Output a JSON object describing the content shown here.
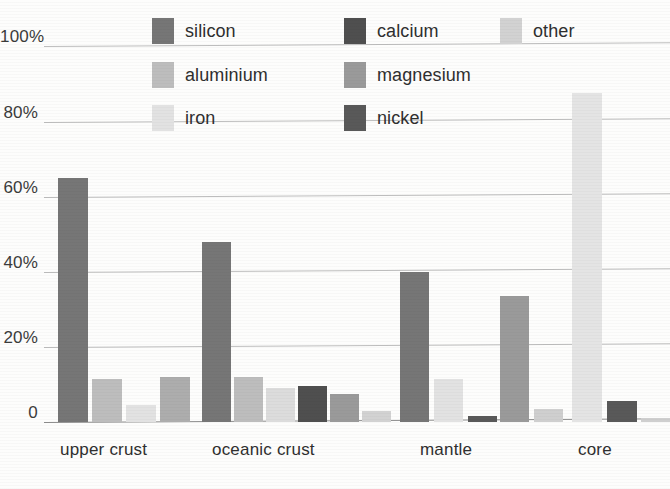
{
  "chart_data": {
    "type": "bar",
    "title": "",
    "subtitle": "",
    "xlabel": "",
    "ylabel": "",
    "ylim": [
      0,
      100
    ],
    "yticks": [
      0,
      20,
      40,
      60,
      80,
      100
    ],
    "ytick_labels": [
      "0",
      "20%",
      "40%",
      "60%",
      "80%",
      "100%"
    ],
    "grid": true,
    "legend_position": "top",
    "categories": [
      "upper crust",
      "oceanic crust",
      "mantle",
      "core"
    ],
    "series": [
      {
        "name": "silicon",
        "color": "#767676",
        "values": [
          65.0,
          48.0,
          40.0,
          null
        ]
      },
      {
        "name": "aluminium",
        "color": "#bdbdbd",
        "values": [
          11.5,
          12.0,
          null,
          null
        ]
      },
      {
        "name": "iron",
        "color": "#e2e2e2",
        "values": [
          4.5,
          9.0,
          11.5,
          87.5
        ]
      },
      {
        "name": "calcium",
        "color": "#4f4f4f",
        "values": [
          null,
          9.5,
          null,
          null
        ]
      },
      {
        "name": "nickel",
        "color": "#595959",
        "values": [
          null,
          null,
          1.5,
          5.5
        ]
      },
      {
        "name": "magnesium",
        "color": "#9a9a9a",
        "values": [
          12.0,
          7.5,
          33.5,
          null
        ]
      },
      {
        "name": "other",
        "color": "#d2d2d2",
        "values": [
          null,
          3.0,
          3.5,
          1.2
        ]
      }
    ],
    "annotations": []
  },
  "legend": {
    "items": [
      {
        "label": "silicon",
        "swatch": "#767676",
        "col": 0,
        "row": 0
      },
      {
        "label": "aluminium",
        "swatch": "#bdbdbd",
        "col": 0,
        "row": 1
      },
      {
        "label": "iron",
        "swatch": "#e2e2e2",
        "col": 0,
        "row": 2
      },
      {
        "label": "calcium",
        "swatch": "#4f4f4f",
        "col": 1,
        "row": 0
      },
      {
        "label": "magnesium",
        "swatch": "#9a9a9a",
        "col": 1,
        "row": 1
      },
      {
        "label": "nickel",
        "swatch": "#595959",
        "col": 1,
        "row": 2
      },
      {
        "label": "other",
        "swatch": "#d2d2d2",
        "col": 2,
        "row": 0
      }
    ]
  },
  "axis": {
    "y_labels": [
      "100%",
      "80%",
      "60%",
      "40%",
      "20%",
      "0"
    ],
    "x_labels": [
      "upper crust",
      "oceanic crust",
      "mantle",
      "core"
    ]
  },
  "bars": [
    {
      "group": "upper crust",
      "series": "silicon",
      "value": 65.0,
      "x": 58,
      "w": 30,
      "color": "#767676"
    },
    {
      "group": "upper crust",
      "series": "aluminium",
      "value": 11.5,
      "x": 92,
      "w": 30,
      "color": "#bdbdbd"
    },
    {
      "group": "upper crust",
      "series": "iron",
      "value": 4.5,
      "x": 126,
      "w": 30,
      "color": "#e2e2e2"
    },
    {
      "group": "upper crust",
      "series": "magnesium",
      "value": 12.0,
      "x": 160,
      "w": 30,
      "color": "#adadad"
    },
    {
      "group": "oceanic crust",
      "series": "silicon",
      "value": 48.0,
      "x": 202,
      "w": 29,
      "color": "#767676"
    },
    {
      "group": "oceanic crust",
      "series": "aluminium",
      "value": 12.0,
      "x": 234,
      "w": 29,
      "color": "#bdbdbd"
    },
    {
      "group": "oceanic crust",
      "series": "iron",
      "value": 9.0,
      "x": 266,
      "w": 29,
      "color": "#dcdcdc"
    },
    {
      "group": "oceanic crust",
      "series": "calcium",
      "value": 9.5,
      "x": 298,
      "w": 29,
      "color": "#4f4f4f"
    },
    {
      "group": "oceanic crust",
      "series": "magnesium",
      "value": 7.5,
      "x": 330,
      "w": 29,
      "color": "#9a9a9a"
    },
    {
      "group": "oceanic crust",
      "series": "other",
      "value": 3.0,
      "x": 362,
      "w": 29,
      "color": "#d2d2d2"
    },
    {
      "group": "mantle",
      "series": "silicon",
      "value": 40.0,
      "x": 400,
      "w": 29,
      "color": "#767676"
    },
    {
      "group": "mantle",
      "series": "iron",
      "value": 11.5,
      "x": 434,
      "w": 29,
      "color": "#e2e2e2"
    },
    {
      "group": "mantle",
      "series": "nickel",
      "value": 1.5,
      "x": 468,
      "w": 29,
      "color": "#595959"
    },
    {
      "group": "mantle",
      "series": "magnesium",
      "value": 33.5,
      "x": 500,
      "w": 29,
      "color": "#9a9a9a"
    },
    {
      "group": "mantle",
      "series": "other",
      "value": 3.5,
      "x": 534,
      "w": 29,
      "color": "#cfcfcf"
    },
    {
      "group": "core",
      "series": "iron",
      "value": 87.5,
      "x": 572,
      "w": 30,
      "color": "#e4e4e4"
    },
    {
      "group": "core",
      "series": "nickel",
      "value": 5.5,
      "x": 607,
      "w": 30,
      "color": "#595959"
    },
    {
      "group": "core",
      "series": "other",
      "value": 1.2,
      "x": 641,
      "w": 29,
      "color": "#cfcfcf"
    }
  ],
  "geometry": {
    "baseline_y": 422,
    "px_per_percent": 3.756,
    "tilt_deg": -0.35
  }
}
